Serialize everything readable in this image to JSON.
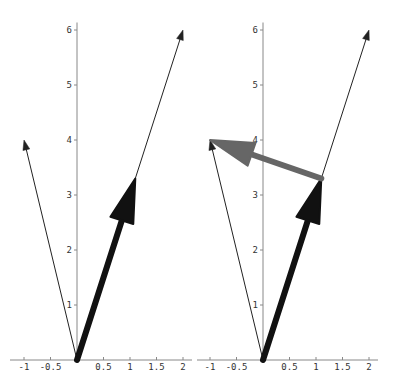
{
  "chart_data": [
    {
      "type": "line",
      "title": "",
      "panel": "left",
      "xlabel": "",
      "ylabel": "",
      "xlim": [
        -1.05,
        2.05
      ],
      "ylim": [
        0,
        6.1
      ],
      "x_ticks": [
        "-1",
        "-0.5",
        "0.5",
        "1",
        "1.5",
        "2"
      ],
      "y_ticks": [
        "1",
        "2",
        "3",
        "4",
        "5",
        "6"
      ],
      "grid": false,
      "series": [
        {
          "name": "thin-vector-a",
          "from": [
            0,
            0
          ],
          "to": [
            2,
            6
          ],
          "color": "#222222",
          "width": "thin"
        },
        {
          "name": "thin-vector-b",
          "from": [
            0,
            0
          ],
          "to": [
            -1,
            4
          ],
          "color": "#222222",
          "width": "thin"
        },
        {
          "name": "thick-vector",
          "from": [
            0,
            0
          ],
          "to": [
            1.1,
            3.3
          ],
          "color": "#111111",
          "width": "thick"
        }
      ]
    },
    {
      "type": "line",
      "title": "",
      "panel": "right",
      "xlabel": "",
      "ylabel": "",
      "xlim": [
        -1.05,
        2.05
      ],
      "ylim": [
        0,
        6.1
      ],
      "x_ticks": [
        "-1",
        "-0.5",
        "0.5",
        "1",
        "1.5",
        "2"
      ],
      "y_ticks": [
        "1",
        "2",
        "3",
        "4",
        "5",
        "6"
      ],
      "grid": false,
      "series": [
        {
          "name": "thin-vector-a",
          "from": [
            0,
            0
          ],
          "to": [
            2,
            6
          ],
          "color": "#222222",
          "width": "thin"
        },
        {
          "name": "thin-vector-b",
          "from": [
            0,
            0
          ],
          "to": [
            -1,
            4
          ],
          "color": "#222222",
          "width": "thin"
        },
        {
          "name": "thick-vector",
          "from": [
            0,
            0
          ],
          "to": [
            1.1,
            3.3
          ],
          "color": "#111111",
          "width": "thick"
        },
        {
          "name": "difference-vector",
          "from": [
            1.1,
            3.3
          ],
          "to": [
            -1,
            4
          ],
          "color": "#666666",
          "width": "thick"
        }
      ]
    }
  ],
  "colors": {
    "axis": "#888888",
    "thin_vector": "#222222",
    "thick_vector": "#111111",
    "difference_vector": "#666666"
  }
}
